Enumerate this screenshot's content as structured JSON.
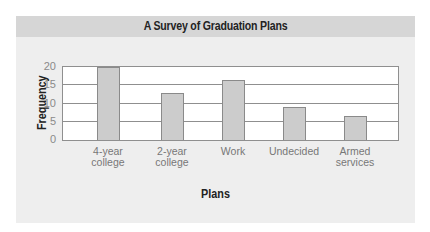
{
  "chart_data": {
    "type": "bar",
    "title": "A Survey of Graduation Plans",
    "xlabel": "Plans",
    "ylabel": "Frequency",
    "categories": [
      "4-year college",
      "2-year college",
      "Work",
      "Undecided",
      "Armed services"
    ],
    "category_lines": [
      [
        "4-year",
        "college"
      ],
      [
        "2-year",
        "college"
      ],
      [
        "Work"
      ],
      [
        "Undecided"
      ],
      [
        "Armed",
        "services"
      ]
    ],
    "values": [
      20,
      13,
      16.5,
      9,
      6.5
    ],
    "ylim": [
      0,
      20
    ],
    "yticks": [
      0,
      5,
      10,
      15,
      20
    ],
    "grid": true,
    "legend": null
  },
  "colors": {
    "header_band": "#d6d6d6",
    "panel_bg": "#eeeeee",
    "plot_bg": "#ffffff",
    "bar_fill": "#cccccc",
    "bar_edge": "#8a8a8a",
    "gridline": "#8f8f8f"
  }
}
